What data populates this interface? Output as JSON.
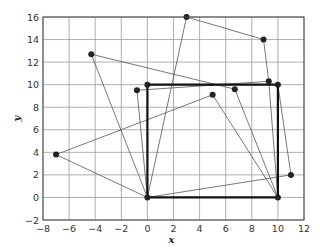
{
  "chart_data": {
    "type": "line",
    "title": "",
    "xlabel": "x",
    "ylabel": "y",
    "xlim": [
      -8,
      12
    ],
    "ylim": [
      -2,
      16
    ],
    "grid": true,
    "legend": null,
    "xticks": [
      -8,
      -6,
      -4,
      -2,
      0,
      2,
      4,
      6,
      8,
      10,
      12
    ],
    "yticks": [
      -2,
      0,
      2,
      4,
      6,
      8,
      10,
      12,
      14,
      16
    ],
    "square": {
      "description": "thick square",
      "points": [
        [
          0,
          0
        ],
        [
          10,
          0
        ],
        [
          10,
          10
        ],
        [
          0,
          10
        ],
        [
          0,
          0
        ]
      ]
    },
    "points": [
      {
        "x": 0,
        "y": 0
      },
      {
        "x": 10,
        "y": 0
      },
      {
        "x": 10,
        "y": 10
      },
      {
        "x": 0,
        "y": 10
      },
      {
        "x": 3.0,
        "y": 16.0
      },
      {
        "x": 8.9,
        "y": 14.0
      },
      {
        "x": -4.3,
        "y": 12.7
      },
      {
        "x": 9.3,
        "y": 10.3
      },
      {
        "x": 6.7,
        "y": 9.6
      },
      {
        "x": 5.0,
        "y": 9.1
      },
      {
        "x": -0.8,
        "y": 9.5
      },
      {
        "x": -7.0,
        "y": 3.8
      },
      {
        "x": 11.0,
        "y": 2.0
      }
    ],
    "segments": [
      [
        [
          0,
          0
        ],
        [
          3.0,
          16.0
        ]
      ],
      [
        [
          3.0,
          16.0
        ],
        [
          8.9,
          14.0
        ]
      ],
      [
        [
          8.9,
          14.0
        ],
        [
          9.3,
          10.3
        ]
      ],
      [
        [
          9.3,
          10.3
        ],
        [
          10,
          0
        ]
      ],
      [
        [
          9.3,
          10.3
        ],
        [
          -0.8,
          9.5
        ]
      ],
      [
        [
          -0.8,
          9.5
        ],
        [
          0,
          0
        ]
      ],
      [
        [
          -4.3,
          12.7
        ],
        [
          6.7,
          9.6
        ]
      ],
      [
        [
          -4.3,
          12.7
        ],
        [
          0,
          0
        ]
      ],
      [
        [
          6.7,
          9.6
        ],
        [
          10,
          0
        ]
      ],
      [
        [
          5.0,
          9.1
        ],
        [
          -7.0,
          3.8
        ]
      ],
      [
        [
          5.0,
          9.1
        ],
        [
          10,
          0
        ]
      ],
      [
        [
          -7.0,
          3.8
        ],
        [
          0,
          0
        ]
      ],
      [
        [
          0,
          0
        ],
        [
          11.0,
          2.0
        ]
      ],
      [
        [
          11.0,
          2.0
        ],
        [
          10,
          10
        ]
      ]
    ]
  }
}
